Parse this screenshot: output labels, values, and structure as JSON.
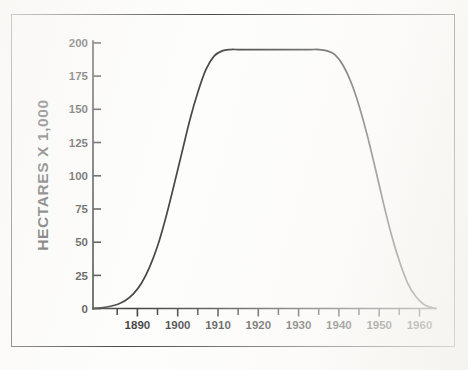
{
  "figure": {
    "name": "hectares-over-time-curve",
    "border_color": "#1d1d1d",
    "curve_color": "#161616",
    "background_color": "#ffffff"
  },
  "chart_data": {
    "type": "line",
    "title": "",
    "subtitle": "",
    "xlabel": "",
    "ylabel": "HECTARES  X  1,000",
    "xlim": [
      1879,
      1964
    ],
    "ylim": [
      0,
      200
    ],
    "grid": false,
    "legend": null,
    "annotations": [],
    "x_major_ticks": [
      1890,
      1900,
      1910,
      1920,
      1930,
      1940,
      1950,
      1960
    ],
    "x_major_tick_labels": [
      "1890",
      "1900",
      "1910",
      "1920",
      "1930",
      "1940",
      "1950",
      "1960"
    ],
    "x_minor_ticks": [
      1885,
      1895,
      1905,
      1915,
      1925,
      1935,
      1945,
      1955
    ],
    "y_ticks": [
      0,
      25,
      50,
      75,
      100,
      125,
      150,
      175,
      200
    ],
    "y_tick_labels": [
      "0",
      "25",
      "50",
      "75",
      "100",
      "125",
      "150",
      "175",
      "200"
    ],
    "series": [
      {
        "name": "hectares",
        "x": [
          1879,
          1881,
          1883,
          1885,
          1887,
          1889,
          1891,
          1893,
          1895,
          1897,
          1899,
          1901,
          1903,
          1905,
          1907,
          1909,
          1911,
          1913,
          1915,
          1917,
          1919,
          1921,
          1923,
          1925,
          1927,
          1929,
          1931,
          1933,
          1935,
          1937,
          1939,
          1941,
          1943,
          1945,
          1947,
          1949,
          1951,
          1953,
          1955,
          1957,
          1959,
          1961,
          1963,
          1964
        ],
        "values": [
          0,
          0.5,
          1.5,
          3,
          6,
          11,
          19,
          31,
          47,
          68,
          92,
          117,
          142,
          163,
          180,
          190,
          194,
          195,
          195,
          195,
          195,
          195,
          195,
          195,
          195,
          195,
          195,
          195,
          195,
          194,
          191,
          183,
          170,
          152,
          130,
          105,
          79,
          55,
          35,
          19,
          9,
          3,
          0.7,
          0
        ]
      }
    ]
  },
  "axis_titles": {
    "y_axis": "HECTARES  X  1,000"
  }
}
